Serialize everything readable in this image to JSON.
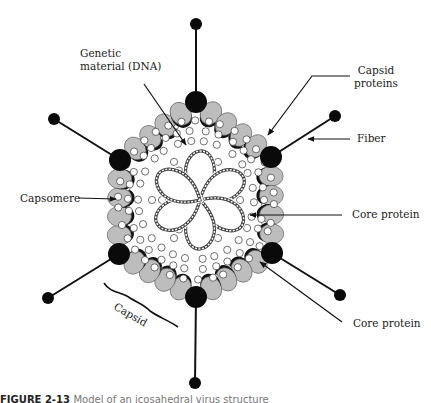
{
  "figure": {
    "type": "adenovirus-structure-diagram",
    "caption_label": "FIGURE 2-13",
    "caption_rest": "Model of an icosahedral virus structure"
  },
  "labels": {
    "genetic_material_line1": "Genetic",
    "genetic_material_line2": "material (DNA)",
    "capsid_proteins_line1": "Capsid",
    "capsid_proteins_line2": "proteins",
    "fiber": "Fiber",
    "capsomere": "Capsomere",
    "core_protein_1": "Core protein",
    "core_protein_2": "Core protein",
    "capsid": "Capsid"
  },
  "colors": {
    "capsomere_fill": "#bdbdbd",
    "capsomere_shadow": "#111111",
    "penton_fill": "#0a0a0a",
    "line": "#111111",
    "dna_strand": "#444444",
    "background": "#ffffff"
  },
  "geometry": {
    "center": [
      196,
      200
    ],
    "vertices": [
      [
        196,
        102
      ],
      [
        271,
        157
      ],
      [
        272,
        253
      ],
      [
        196,
        297
      ],
      [
        119,
        254
      ],
      [
        120,
        160
      ]
    ],
    "knobs": [
      [
        196,
        24
      ],
      [
        335,
        116
      ],
      [
        340,
        295
      ],
      [
        195,
        383
      ],
      [
        48,
        298
      ],
      [
        54,
        119
      ]
    ],
    "petal_count": 6
  }
}
